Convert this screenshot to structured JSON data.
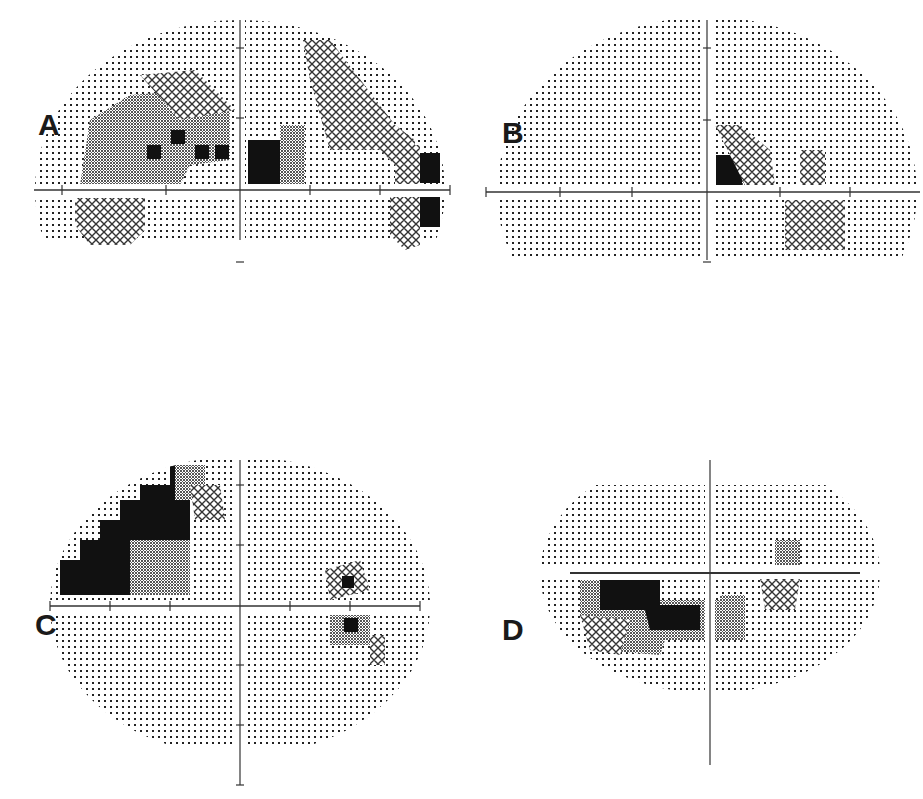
{
  "figure": {
    "panels": [
      {
        "id": "A",
        "label": "A",
        "x": 20,
        "y": 0,
        "w": 430,
        "h": 250,
        "axis": {
          "cx": 220,
          "cy": 190,
          "hx0": 14,
          "hx1": 430,
          "vy0": 20,
          "vy1": 240,
          "hticks": [
            42,
            146,
            290,
            360,
            430
          ],
          "vticks": [
            48,
            118,
            262
          ]
        },
        "field": {
          "type": "ellipse",
          "cx": 220,
          "cy": 190,
          "rx": 205,
          "ry": 170,
          "top": 20,
          "bottom": 240
        },
        "regions": [
          {
            "kind": "gray",
            "pts": [
              [
                70,
                120
              ],
              [
                110,
                95
              ],
              [
                180,
                90
              ],
              [
                210,
                110
              ],
              [
                210,
                160
              ],
              [
                170,
                165
              ],
              [
                160,
                185
              ],
              [
                60,
                185
              ]
            ]
          },
          {
            "kind": "hatch",
            "pts": [
              [
                120,
                75
              ],
              [
                175,
                70
              ],
              [
                215,
                110
              ],
              [
                160,
                120
              ]
            ]
          },
          {
            "kind": "black",
            "x": 151,
            "y": 130,
            "w": 14,
            "h": 14
          },
          {
            "kind": "black",
            "x": 175,
            "y": 145,
            "w": 14,
            "h": 14
          },
          {
            "kind": "black",
            "x": 195,
            "y": 145,
            "w": 14,
            "h": 14
          },
          {
            "kind": "black",
            "x": 127,
            "y": 145,
            "w": 14,
            "h": 14
          },
          {
            "kind": "black",
            "x": 228,
            "y": 140,
            "w": 45,
            "h": 45
          },
          {
            "kind": "gray",
            "pts": [
              [
                260,
                125
              ],
              [
                285,
                125
              ],
              [
                285,
                185
              ],
              [
                260,
                185
              ]
            ]
          },
          {
            "kind": "hatch",
            "pts": [
              [
                283,
                40
              ],
              [
                310,
                40
              ],
              [
                375,
                125
              ],
              [
                395,
                140
              ],
              [
                395,
                185
              ],
              [
                360,
                150
              ],
              [
                310,
                150
              ],
              [
                290,
                80
              ]
            ]
          },
          {
            "kind": "black",
            "x": 398,
            "y": 153,
            "w": 22,
            "h": 30
          },
          {
            "kind": "hatch",
            "pts": [
              [
                375,
                145
              ],
              [
                400,
                145
              ],
              [
                400,
                185
              ],
              [
                375,
                185
              ]
            ]
          },
          {
            "kind": "black",
            "x": 398,
            "y": 197,
            "w": 22,
            "h": 30
          },
          {
            "kind": "hatch",
            "pts": [
              [
                370,
                197
              ],
              [
                400,
                197
              ],
              [
                400,
                245
              ],
              [
                385,
                250
              ],
              [
                370,
                235
              ]
            ]
          },
          {
            "kind": "black",
            "x": 85,
            "y": 198,
            "w": 20,
            "h": 40
          },
          {
            "kind": "hatch",
            "pts": [
              [
                55,
                198
              ],
              [
                125,
                198
              ],
              [
                125,
                230
              ],
              [
                110,
                245
              ],
              [
                70,
                245
              ],
              [
                55,
                225
              ]
            ]
          }
        ]
      },
      {
        "id": "B",
        "label": "B",
        "x": 480,
        "y": 0,
        "w": 443,
        "h": 260,
        "axis": {
          "cx": 227,
          "cy": 192,
          "hx0": 6,
          "hx1": 440,
          "vy0": 20,
          "vy1": 260,
          "hticks": [
            6,
            80,
            152,
            300,
            370
          ],
          "vticks": [
            48,
            120,
            262
          ]
        },
        "field": {
          "type": "ellipse",
          "cx": 227,
          "cy": 192,
          "rx": 210,
          "ry": 175,
          "top": 20,
          "bottom": 260
        },
        "regions": [
          {
            "kind": "black",
            "x": 236,
            "y": 155,
            "w": 28,
            "h": 30
          },
          {
            "kind": "gray",
            "pts": [
              [
                262,
                140
              ],
              [
                280,
                140
              ],
              [
                280,
                185
              ],
              [
                262,
                185
              ]
            ]
          },
          {
            "kind": "hatch",
            "pts": [
              [
                235,
                125
              ],
              [
                260,
                125
              ],
              [
                290,
                150
              ],
              [
                295,
                185
              ],
              [
                265,
                185
              ]
            ]
          },
          {
            "kind": "hatch",
            "pts": [
              [
                320,
                150
              ],
              [
                345,
                150
              ],
              [
                345,
                185
              ],
              [
                320,
                185
              ]
            ]
          },
          {
            "kind": "gray",
            "pts": [
              [
                320,
                200
              ],
              [
                355,
                200
              ],
              [
                355,
                230
              ],
              [
                335,
                240
              ],
              [
                320,
                225
              ]
            ]
          },
          {
            "kind": "hatch",
            "pts": [
              [
                305,
                200
              ],
              [
                365,
                200
              ],
              [
                365,
                250
              ],
              [
                305,
                250
              ]
            ]
          }
        ]
      },
      {
        "id": "C",
        "label": "C",
        "x": 30,
        "y": 440,
        "w": 400,
        "h": 359,
        "axis": {
          "cx": 210,
          "cy": 166,
          "hx0": 20,
          "hx1": 390,
          "vy0": 20,
          "vy1": 345,
          "hticks": [
            20,
            80,
            140,
            260,
            320,
            390
          ],
          "vticks": [
            45,
            105,
            225,
            285,
            345
          ]
        },
        "field": {
          "type": "ellipse",
          "cx": 210,
          "cy": 166,
          "rx": 190,
          "ry": 150,
          "top": 20,
          "bottom": 305
        },
        "regions": [
          {
            "kind": "black",
            "pts": [
              [
                30,
                120
              ],
              [
                50,
                120
              ],
              [
                50,
                100
              ],
              [
                70,
                100
              ],
              [
                70,
                80
              ],
              [
                90,
                80
              ],
              [
                90,
                60
              ],
              [
                110,
                60
              ],
              [
                110,
                45
              ],
              [
                140,
                45
              ],
              [
                140,
                25
              ],
              [
                160,
                25
              ],
              [
                160,
                155
              ],
              [
                30,
                155
              ]
            ]
          },
          {
            "kind": "gray",
            "pts": [
              [
                100,
                100
              ],
              [
                160,
                100
              ],
              [
                160,
                155
              ],
              [
                100,
                155
              ]
            ]
          },
          {
            "kind": "gray",
            "pts": [
              [
                145,
                25
              ],
              [
                175,
                25
              ],
              [
                175,
                60
              ],
              [
                145,
                60
              ]
            ]
          },
          {
            "kind": "hatch",
            "pts": [
              [
                160,
                45
              ],
              [
                190,
                45
              ],
              [
                195,
                80
              ],
              [
                165,
                80
              ]
            ]
          },
          {
            "kind": "hatch",
            "pts": [
              [
                295,
                130
              ],
              [
                330,
                120
              ],
              [
                340,
                150
              ],
              [
                300,
                160
              ]
            ]
          },
          {
            "kind": "black",
            "x": 312,
            "y": 136,
            "w": 12,
            "h": 12
          },
          {
            "kind": "gray",
            "pts": [
              [
                300,
                175
              ],
              [
                340,
                175
              ],
              [
                340,
                205
              ],
              [
                300,
                205
              ]
            ]
          },
          {
            "kind": "black",
            "x": 314,
            "y": 178,
            "w": 14,
            "h": 14
          },
          {
            "kind": "hatch",
            "pts": [
              [
                340,
                195
              ],
              [
                355,
                195
              ],
              [
                355,
                225
              ],
              [
                340,
                225
              ]
            ]
          }
        ]
      },
      {
        "id": "D",
        "label": "D",
        "x": 480,
        "y": 440,
        "w": 443,
        "h": 359,
        "axis": {
          "cx": 230,
          "cy": 133,
          "hx0": 90,
          "hx1": 380,
          "vy0": 20,
          "vy1": 325,
          "hticks": [],
          "vticks": []
        },
        "field": {
          "type": "ellipse",
          "cx": 230,
          "cy": 133,
          "rx": 170,
          "ry": 120,
          "top": 45,
          "bottom": 310
        },
        "regions": [
          {
            "kind": "gray",
            "pts": [
              [
                100,
                140
              ],
              [
                180,
                140
              ],
              [
                180,
                160
              ],
              [
                240,
                160
              ],
              [
                240,
                200
              ],
              [
                185,
                200
              ],
              [
                180,
                215
              ],
              [
                120,
                210
              ],
              [
                100,
                175
              ]
            ]
          },
          {
            "kind": "black",
            "pts": [
              [
                120,
                140
              ],
              [
                180,
                140
              ],
              [
                180,
                165
              ],
              [
                220,
                165
              ],
              [
                220,
                190
              ],
              [
                170,
                190
              ],
              [
                165,
                170
              ],
              [
                120,
                170
              ]
            ]
          },
          {
            "kind": "black",
            "x": 240,
            "y": 165,
            "w": 20,
            "h": 20
          },
          {
            "kind": "gray",
            "pts": [
              [
                240,
                155
              ],
              [
                265,
                155
              ],
              [
                265,
                200
              ],
              [
                240,
                200
              ]
            ]
          },
          {
            "kind": "hatch",
            "pts": [
              [
                100,
                175
              ],
              [
                150,
                180
              ],
              [
                140,
                215
              ],
              [
                110,
                210
              ]
            ]
          },
          {
            "kind": "black",
            "x": 290,
            "y": 138,
            "w": 16,
            "h": 16
          },
          {
            "kind": "hatch",
            "pts": [
              [
                280,
                138
              ],
              [
                320,
                138
              ],
              [
                315,
                170
              ],
              [
                285,
                170
              ]
            ]
          },
          {
            "kind": "gray",
            "pts": [
              [
                295,
                100
              ],
              [
                320,
                100
              ],
              [
                320,
                125
              ],
              [
                295,
                125
              ]
            ]
          }
        ]
      }
    ]
  },
  "colors": {
    "ink": "#1a1a1a",
    "axis": "#333333",
    "gray_fill": "#8a8a8a",
    "bleed_text": "#e4e4e4"
  }
}
